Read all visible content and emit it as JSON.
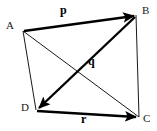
{
  "figure": {
    "type": "vector-quadrilateral-diagram",
    "background_color": "#ffffff",
    "stroke_color": "#1a1a1a",
    "thick_stroke_color": "#000000",
    "width": 157,
    "height": 131,
    "vertices": [
      {
        "id": "A",
        "label": "A",
        "x": 23,
        "y": 31,
        "label_x": 6,
        "label_y": 20
      },
      {
        "id": "B",
        "label": "B",
        "x": 136,
        "y": 15,
        "label_x": 142,
        "label_y": 5
      },
      {
        "id": "C",
        "label": "C",
        "x": 139,
        "y": 117,
        "label_x": 143,
        "label_y": 113
      },
      {
        "id": "D",
        "label": "D",
        "x": 36,
        "y": 110,
        "label_x": 21,
        "label_y": 102
      }
    ],
    "edges": [
      {
        "id": "AD",
        "from": "A",
        "to": "D",
        "style": "thin",
        "width": 1
      },
      {
        "id": "BC",
        "from": "B",
        "to": "C",
        "style": "thin",
        "width": 1
      },
      {
        "id": "AC",
        "from": "A",
        "to": "C",
        "style": "thin",
        "width": 1
      }
    ],
    "vectors": [
      {
        "id": "p",
        "label": "p",
        "from": "A",
        "to": "B",
        "style": "thick-arrow",
        "width": 2.4,
        "label_x": 60,
        "label_y": 4
      },
      {
        "id": "q",
        "label": "q",
        "from": "B",
        "to": "D",
        "style": "thick-arrow",
        "width": 2.4,
        "label_x": 88,
        "label_y": 55
      },
      {
        "id": "r",
        "label": "r",
        "from": "D",
        "to": "C",
        "style": "thick-arrow",
        "width": 2.4,
        "label_x": 81,
        "label_y": 113
      }
    ]
  }
}
